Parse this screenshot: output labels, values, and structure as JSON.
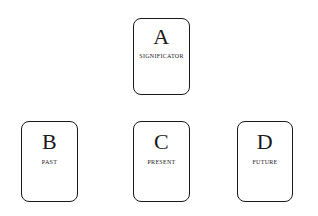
{
  "diagram": {
    "background_color": "#ffffff",
    "ink_color": "#1a1a1a",
    "cards": [
      {
        "letter": "A",
        "label": "Significator",
        "position": "top-center"
      },
      {
        "letter": "B",
        "label": "Past",
        "position": "bottom-left"
      },
      {
        "letter": "C",
        "label": "Present",
        "position": "bottom-center"
      },
      {
        "letter": "D",
        "label": "Future",
        "position": "bottom-right"
      }
    ]
  }
}
